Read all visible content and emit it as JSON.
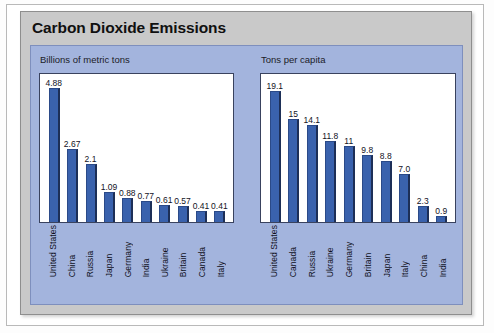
{
  "figure": {
    "title": "Carbon Dioxide Emissions"
  },
  "colors": {
    "bar": "#3a62ad",
    "bar_shadow": "#1d2f57",
    "panel_background": "#a3b4dd",
    "header_background": "#c9c9c9",
    "plot_background": "#ffffff",
    "plot_border": "#39425e",
    "text": "#11111c"
  },
  "charts": {
    "left": {
      "subtitle": "Billions of metric tons"
    },
    "right": {
      "subtitle": "Tons per capita"
    }
  },
  "chart_data": [
    {
      "type": "bar",
      "title": "Billions of metric tons",
      "subtitle": "",
      "xlabel": "",
      "ylabel": "Billions of metric tons",
      "ylim": [
        0,
        5.4
      ],
      "grid": false,
      "legend": "none",
      "orientation": "vertical",
      "categories": [
        "United States",
        "China",
        "Russia",
        "Japan",
        "Germany",
        "India",
        "Ukraine",
        "Britain",
        "Canada",
        "Italy"
      ],
      "values": [
        4.88,
        2.67,
        2.1,
        1.09,
        0.88,
        0.77,
        0.61,
        0.57,
        0.41,
        0.41
      ],
      "value_labels": [
        "4.88",
        "2.67",
        "2.1",
        "1.09",
        "0.88",
        "0.77",
        "0.61",
        "0.57",
        "0.41",
        "0.41"
      ]
    },
    {
      "type": "bar",
      "title": "Tons per capita",
      "subtitle": "",
      "xlabel": "",
      "ylabel": "Tons per capita",
      "ylim": [
        0,
        21.5
      ],
      "grid": false,
      "legend": "none",
      "orientation": "vertical",
      "categories": [
        "United States",
        "Canada",
        "Russia",
        "Ukraine",
        "Germany",
        "Britain",
        "Japan",
        "Italy",
        "China",
        "India"
      ],
      "values": [
        19.1,
        15,
        14.1,
        11.8,
        11,
        9.8,
        8.8,
        7.0,
        2.3,
        0.9
      ],
      "value_labels": [
        "19.1",
        "15",
        "14.1",
        "11.8",
        "11",
        "9.8",
        "8.8",
        "7.0",
        "2.3",
        "0.9"
      ]
    }
  ]
}
